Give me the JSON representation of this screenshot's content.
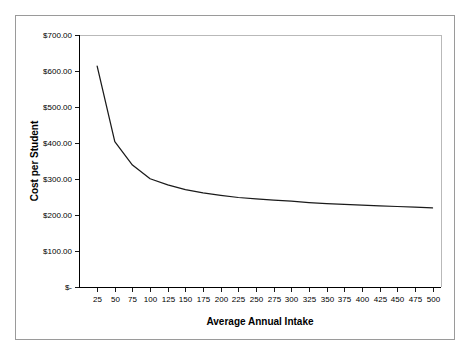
{
  "figure": {
    "background_color": "#ffffff",
    "frame_color": "#9a9a9a",
    "plot_area_border_color": "#b9b9b9",
    "series_color": "#1a1a1a"
  },
  "chart_data": {
    "type": "line",
    "title": "",
    "xlabel": "Average Annual Intake",
    "ylabel": "Cost per Student",
    "xlim": [
      0,
      512
    ],
    "ylim": [
      0,
      700
    ],
    "grid": false,
    "legend": "none",
    "x_tick_labels": [
      "25",
      "50",
      "75",
      "100",
      "125",
      "150",
      "175",
      "200",
      "225",
      "250",
      "275",
      "300",
      "325",
      "350",
      "375",
      "400",
      "425",
      "450",
      "475",
      "500"
    ],
    "x_tick_values": [
      25,
      50,
      75,
      100,
      125,
      150,
      175,
      200,
      225,
      250,
      275,
      300,
      325,
      350,
      375,
      400,
      425,
      450,
      475,
      500
    ],
    "y_tick_labels": [
      "$-",
      "$100.00",
      "$200.00",
      "$300.00",
      "$400.00",
      "$500.00",
      "$600.00",
      "$700.00"
    ],
    "y_tick_values": [
      0,
      100,
      200,
      300,
      400,
      500,
      600,
      700
    ],
    "series": [
      {
        "name": "Cost per Student",
        "x": [
          25,
          50,
          75,
          100,
          125,
          150,
          175,
          200,
          225,
          250,
          275,
          300,
          325,
          350,
          375,
          400,
          425,
          450,
          475,
          500
        ],
        "values": [
          615,
          405,
          340,
          302,
          285,
          272,
          263,
          256,
          250,
          246,
          243,
          240,
          236,
          233,
          231,
          229,
          227,
          225,
          223,
          221
        ]
      }
    ]
  }
}
